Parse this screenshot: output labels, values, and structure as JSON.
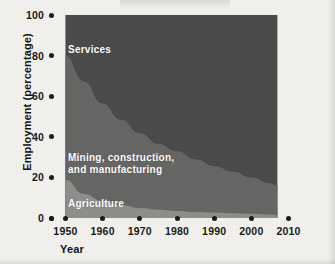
{
  "chart_data": {
    "type": "area",
    "title": "",
    "subtitle": "",
    "xlabel": "Year",
    "ylabel": "Employment (percentage)",
    "xlim": [
      1948,
      2012
    ],
    "ylim": [
      0,
      100
    ],
    "grid": false,
    "legend_position": "inside-plot-labels",
    "stacked": true,
    "stack_total": 100,
    "x": [
      1950,
      1955,
      1960,
      1965,
      1970,
      1975,
      1980,
      1985,
      1990,
      1995,
      2000,
      2005,
      2007
    ],
    "x_tick_labels": [
      "1950",
      "1960",
      "1970",
      "1980",
      "1990",
      "2000",
      "2010"
    ],
    "x_ticks": [
      1950,
      1960,
      1970,
      1980,
      1990,
      2000,
      2010
    ],
    "y_ticks": [
      0,
      20,
      40,
      60,
      80,
      100
    ],
    "y_tick_labels": [
      "0",
      "20",
      "40",
      "60",
      "80",
      "100"
    ],
    "series": [
      {
        "name": "Agriculture",
        "color": "#8e8e8b",
        "label_color": "#ffffff",
        "values": [
          19.0,
          12.0,
          8.5,
          6.5,
          5.0,
          4.2,
          3.6,
          3.1,
          2.8,
          2.5,
          2.2,
          1.8,
          1.6
        ]
      },
      {
        "name": "Mining, construction,\nand manufacturing",
        "color": "#666664",
        "label_color": "#ffffff",
        "values": [
          61.0,
          55.5,
          48.0,
          42.0,
          37.0,
          32.5,
          29.5,
          26.0,
          23.0,
          20.5,
          18.0,
          15.5,
          14.5
        ]
      },
      {
        "name": "Services",
        "color": "#4b4b4b",
        "label_color": "#ffffff",
        "values": [
          20.0,
          32.5,
          43.5,
          51.5,
          58.0,
          63.3,
          66.9,
          70.9,
          74.2,
          77.0,
          79.8,
          82.7,
          83.9
        ]
      }
    ],
    "series_labels": [
      {
        "name": "Services",
        "text": "Services"
      },
      {
        "name": "Mining, construction, and manufacturing",
        "text": "Mining, construction,\nand manufacturing"
      },
      {
        "name": "Agriculture",
        "text": "Agriculture"
      }
    ],
    "boundaries_note": "Cumulative upper boundary of Agriculture and of Agriculture+Mining; Services fills to 100.",
    "colors": {
      "background": "#f2f1ee",
      "axis_text": "#191919",
      "tick_dot": "#1b1b1b",
      "agriculture": "#8e8e8b",
      "mining": "#666664",
      "services": "#4b4b4b"
    }
  }
}
